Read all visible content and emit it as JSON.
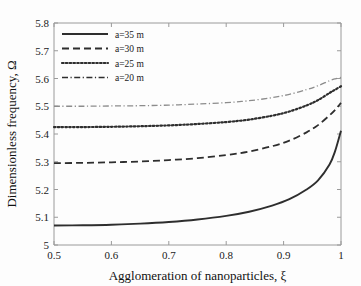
{
  "chart_data": {
    "type": "line",
    "title": "",
    "xlabel": "Agglomeration of nanoparticles, ξ",
    "ylabel": "Dimensionless frequency, Ω",
    "xlim": [
      0.5,
      1.0
    ],
    "ylim": [
      5.0,
      5.8
    ],
    "xticks": [
      "0.5",
      "0.6",
      "0.7",
      "0.8",
      "0.9",
      "1"
    ],
    "xtick_values": [
      0.5,
      0.6,
      0.7,
      0.8,
      0.9,
      1.0
    ],
    "yticks": [
      "5",
      "5.1",
      "5.2",
      "5.3",
      "5.4",
      "5.5",
      "5.6",
      "5.7",
      "5.8"
    ],
    "ytick_values": [
      5.0,
      5.1,
      5.2,
      5.3,
      5.4,
      5.5,
      5.6,
      5.7,
      5.8
    ],
    "grid": false,
    "legend_position": "upper-left",
    "x": [
      0.5,
      0.55,
      0.6,
      0.65,
      0.7,
      0.75,
      0.8,
      0.84,
      0.88,
      0.91,
      0.94,
      0.96,
      0.98,
      0.99,
      1.0
    ],
    "series": [
      {
        "name": "a=35 m",
        "label": "a=35 m",
        "style": "solid",
        "color": "#2e2e2e",
        "values": [
          5.07,
          5.071,
          5.073,
          5.077,
          5.083,
          5.092,
          5.105,
          5.12,
          5.142,
          5.165,
          5.2,
          5.233,
          5.29,
          5.34,
          5.412
        ]
      },
      {
        "name": "a=30 m",
        "label": "a=30 m",
        "style": "dashed",
        "color": "#2e2e2e",
        "values": [
          5.295,
          5.296,
          5.298,
          5.301,
          5.306,
          5.313,
          5.324,
          5.337,
          5.356,
          5.376,
          5.406,
          5.432,
          5.467,
          5.487,
          5.512
        ]
      },
      {
        "name": "a=25 m",
        "label": "a=25 m",
        "style": "dotted",
        "color": "#2e2e2e",
        "values": [
          5.425,
          5.425,
          5.426,
          5.428,
          5.431,
          5.436,
          5.443,
          5.452,
          5.466,
          5.481,
          5.503,
          5.522,
          5.548,
          5.56,
          5.572
        ]
      },
      {
        "name": "a=20 m",
        "label": "a=20 m",
        "style": "dashdot",
        "color": "#8c8c8c",
        "values": [
          5.5,
          5.5,
          5.501,
          5.502,
          5.504,
          5.508,
          5.513,
          5.52,
          5.531,
          5.543,
          5.56,
          5.574,
          5.592,
          5.599,
          5.604
        ]
      }
    ]
  },
  "legend": {
    "entries": [
      {
        "label": "a=35 m"
      },
      {
        "label": "a=30 m"
      },
      {
        "label": "a=25 m"
      },
      {
        "label": "a=20 m"
      }
    ]
  }
}
